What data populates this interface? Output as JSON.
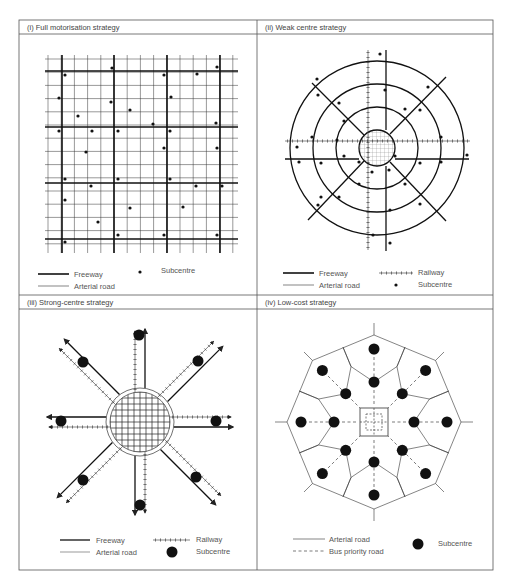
{
  "figure": {
    "panels": [
      {
        "id": "i",
        "title": "(i) Full motorisation strategy",
        "legend": {
          "freeway": "Freeway",
          "arterial": "Arterial road",
          "subcentre": "Subcentre"
        }
      },
      {
        "id": "ii",
        "title": "(ii) Weak centre strategy",
        "legend": {
          "freeway": "Freeway",
          "arterial": "Arterial road",
          "railway": "Railway",
          "subcentre": "Subcentre"
        }
      },
      {
        "id": "iii",
        "title": "(iii) Strong-centre strategy",
        "legend": {
          "freeway": "Freeway",
          "arterial": "Arterial road",
          "railway": "Railway",
          "subcentre": "Subcentre"
        }
      },
      {
        "id": "iv",
        "title": "(iv) Low-cost strategy",
        "legend": {
          "arterial": "Arterial road",
          "bus": "Bus priority road",
          "subcentre": "Subcentre"
        }
      }
    ],
    "colors": {
      "line": "#222222",
      "frame": "#555555",
      "text": "#444444"
    },
    "panel_i": {
      "grid": {
        "x0": 45,
        "x1": 238,
        "y0": 55,
        "y1": 253,
        "step": 13.2
      },
      "freeway_x": [
        62,
        114,
        167,
        220
      ],
      "freeway_y": [
        71,
        127,
        183,
        239
      ],
      "subcentres": [
        [
          65,
          75
        ],
        [
          112,
          68
        ],
        [
          164,
          75
        ],
        [
          197,
          74
        ],
        [
          217,
          67
        ],
        [
          59,
          98
        ],
        [
          111,
          102
        ],
        [
          171,
          97
        ],
        [
          78,
          116
        ],
        [
          130,
          110
        ],
        [
          153,
          124
        ],
        [
          216,
          123
        ],
        [
          59,
          131
        ],
        [
          92,
          131
        ],
        [
          118,
          131
        ],
        [
          170,
          131
        ],
        [
          164,
          148
        ],
        [
          217,
          148
        ],
        [
          86,
          152
        ],
        [
          65,
          179
        ],
        [
          118,
          179
        ],
        [
          170,
          179
        ],
        [
          91,
          186
        ],
        [
          196,
          186
        ],
        [
          222,
          186
        ],
        [
          65,
          200
        ],
        [
          130,
          208
        ],
        [
          183,
          207
        ],
        [
          98,
          222
        ],
        [
          118,
          235
        ],
        [
          164,
          235
        ],
        [
          217,
          235
        ],
        [
          65,
          242
        ]
      ]
    },
    "panel_ii": {
      "center": [
        377,
        148
      ],
      "rings": [
        18,
        41,
        64,
        87
      ],
      "subcentres": [
        [
          380,
          54
        ],
        [
          317,
          79
        ],
        [
          318,
          95
        ],
        [
          385,
          90
        ],
        [
          339,
          103
        ],
        [
          428,
          87
        ],
        [
          405,
          109
        ],
        [
          420,
          110
        ],
        [
          344,
          121
        ],
        [
          337,
          140
        ],
        [
          312,
          137
        ],
        [
          297,
          147
        ],
        [
          441,
          137
        ],
        [
          467,
          155
        ],
        [
          299,
          162
        ],
        [
          321,
          163
        ],
        [
          344,
          156
        ],
        [
          359,
          162
        ],
        [
          395,
          156
        ],
        [
          420,
          163
        ],
        [
          441,
          162
        ],
        [
          372,
          172
        ],
        [
          389,
          170
        ],
        [
          359,
          184
        ],
        [
          405,
          184
        ],
        [
          321,
          197
        ],
        [
          339,
          197
        ],
        [
          420,
          204
        ],
        [
          318,
          205
        ],
        [
          390,
          210
        ],
        [
          373,
          235
        ],
        [
          390,
          243
        ]
      ]
    },
    "panel_iii": {
      "center": [
        140,
        422
      ],
      "radius": 33,
      "subcentres": [
        [
          139,
          335
        ],
        [
          83,
          362
        ],
        [
          198,
          361
        ],
        [
          61,
          421
        ],
        [
          216,
          421
        ],
        [
          83,
          480
        ],
        [
          196,
          477
        ],
        [
          140,
          505
        ]
      ]
    },
    "panel_iv": {
      "center": [
        374,
        422
      ],
      "octagon_r": 87,
      "outer_subcentres_r": 73,
      "inner_subcentres_r": 40
    }
  }
}
